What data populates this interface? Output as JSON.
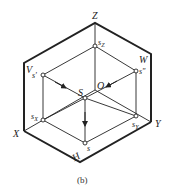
{
  "figure": {
    "caption": "(b)",
    "axes": {
      "Z": "Z",
      "X": "X",
      "Y": "Y",
      "origin": "O"
    },
    "planes": {
      "V": "V",
      "W": "W",
      "H": "H"
    },
    "points": {
      "S": "S",
      "s_prime": "s'",
      "s_double_prime": "s\"",
      "s": "s",
      "s_x": "s",
      "s_x_sub": "X",
      "s_y": "s",
      "s_y_sub": "Y",
      "s_z": "s",
      "s_z_sub": "Z"
    },
    "colors": {
      "line": "#222222",
      "background": "#ffffff"
    }
  }
}
